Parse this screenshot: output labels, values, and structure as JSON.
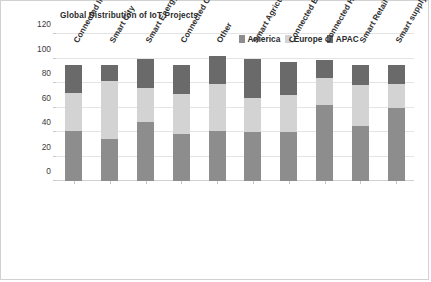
{
  "chart_data": {
    "type": "bar",
    "subtype": "stacked-column",
    "title": "Global Distribution of IoT Projects",
    "xlabel": "",
    "ylabel": "",
    "ylim": [
      0,
      120
    ],
    "ytick_step": 20,
    "ytick_labels": [
      "120",
      "100",
      "80",
      "60",
      "40",
      "20",
      "0"
    ],
    "ytick_values": [
      120,
      100,
      80,
      60,
      40,
      20,
      0
    ],
    "grid": true,
    "grid_axis": "y",
    "legend_position": "top-right",
    "categories": [
      "Connected Industry",
      "Smart City",
      "Smart Energy",
      "Connected Car",
      "Other",
      "Smart Agriculture",
      "Connected Building",
      "Connected Health",
      "Smart Retail",
      "Smart supply chain"
    ],
    "series": [
      {
        "name": "America",
        "color": "#8d8d8d",
        "values": [
          41,
          34,
          48,
          38,
          41,
          40,
          40,
          62,
          45,
          60
        ]
      },
      {
        "name": "Europe",
        "color": "#d3d3d3",
        "values": [
          31,
          48,
          28,
          33,
          38,
          28,
          30,
          22,
          33,
          19
        ]
      },
      {
        "name": "APAC",
        "color": "#6a6a6a",
        "values": [
          23,
          13,
          24,
          24,
          23,
          32,
          27,
          15,
          17,
          16
        ]
      }
    ],
    "stack_totals": [
      95,
      95,
      100,
      95,
      102,
      100,
      97,
      99,
      95,
      95
    ]
  },
  "legend": {
    "entries": [
      {
        "label": "America",
        "color": "#8d8d8d"
      },
      {
        "label": "Europe",
        "color": "#d3d3d3"
      },
      {
        "label": "APAC",
        "color": "#6a6a6a"
      }
    ]
  }
}
